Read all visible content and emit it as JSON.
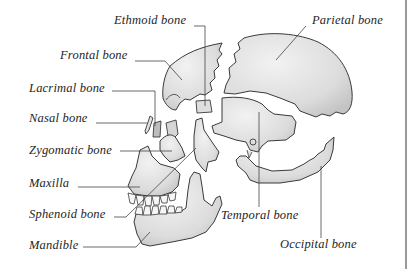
{
  "diagram": {
    "colors": {
      "bone_fill": "#e2e2e2",
      "bone_shadow": "#c8c8c8",
      "outline": "#3a3a3a",
      "leader_line": "#444444",
      "text": "#1e1e1e",
      "border": "#9a9a9a"
    },
    "labels": {
      "ethmoid": "Ethmoid bone",
      "frontal": "Frontal bone",
      "lacrimal": "Lacrimal bone",
      "nasal": "Nasal bone",
      "zygomatic": "Zygomatic bone",
      "maxilla": "Maxilla",
      "sphenoid": "Sphenoid bone",
      "mandible": "Mandible",
      "parietal": "Parietal bone",
      "temporal": "Temporal bone",
      "occipital": "Occipital bone"
    }
  }
}
